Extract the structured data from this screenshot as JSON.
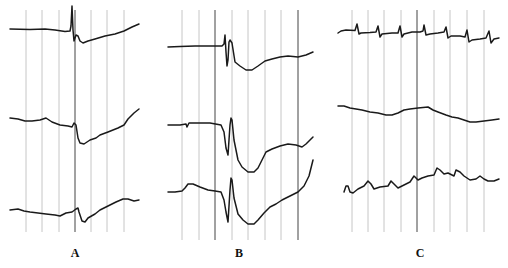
{
  "figure": {
    "background": "#ffffff",
    "panels": [
      {
        "id": "A",
        "label": "A",
        "label_pos": [
          75,
          246
        ],
        "grid": {
          "x": [
            26,
            42,
            59,
            75,
            91,
            107,
            124
          ],
          "dark": [
            75
          ],
          "y_top": 10,
          "y_bottom": 232
        },
        "traces": [
          {
            "d": "M10,29 L30,29.5 L45,29 L55,30 L65,31.5 L70,31 L71,26 L72,6 L73,30 L74,41 L75,38 L76,35 L78,36 L80,41 L83,43 L88,41 L95,39 L105,36 L115,34 L124,31 L132,27 L139,24",
            "dash": false
          },
          {
            "d": "M10,118 L18,119 L25,121 L32,121 L40,120 L46,118 L52,122 L60,125 L68,126 L72,127 L74,123 L76,125 L78,138 L80,143 L84,144 L90,140 L96,138 L100,135 L108,132 L118,128 L124,125 L128,119 L134,113 L139,109",
            "dash": false
          },
          {
            "d": "M10,210 L18,209 L24,211 L30,212 L38,213 L46,214 L55,215 L60,216 L66,213 L72,212 L76,209 L78,208 L79,212 L82,221 L85,222 L88,218 L95,214 L100,210 L108,206 L116,202 L123,199 L128,199 L134,201 L139,200",
            "dash": false
          }
        ]
      },
      {
        "id": "B",
        "label": "B",
        "label_pos": [
          239,
          246
        ],
        "grid": {
          "x": [
            182,
            199,
            215,
            232,
            248,
            265,
            281,
            298
          ],
          "dark": [
            215,
            298
          ],
          "y_top": 10,
          "y_bottom": 240
        },
        "traces": [
          {
            "d": "M168,47 L180,46.5 L195,46 L210,46 L222,46 L224,44 L225,35 L226,52 L227,66 L228,60 L229,42 L230,40 L232,43 L235,62 L240,66 L246,70 L252,70 L258,66 L265,61 L272,59 L280,57 L288,56 L298,57 L306,55 L313,52",
            "dash": false
          },
          {
            "d": "M168,125 L180,125 L186,124 L187,127 L189,123 L198,123 L210,123 L221,125 L224,132 L226,148 L228,155 L230,125 L231,118 L232,120 L234,140 L238,160 L242,167 L248,172 L254,172 L258,168 L262,160 L266,152 L272,149 L280,146 L288,144 L296,145 L302,147 L306,144 L310,140 L313,137",
            "dash": false
          },
          {
            "d": "M168,192 L175,192 L182,191 L185,188 L188,184 L193,184 L200,187 L208,190 L215,191 L221,192 L224,200 L226,212 L228,222 L230,190 L231,178 L232,180 L234,198 L238,214 L243,220 L248,224 L254,224 L258,220 L264,213 L270,207 L276,204 L282,200 L290,196 L298,192 L304,186 L309,176 L313,160",
            "dash": false
          }
        ]
      },
      {
        "id": "C",
        "label": "C",
        "label_pos": [
          420,
          246
        ],
        "grid": {
          "x": [
            352,
            368,
            384,
            401,
            417,
            434,
            450,
            467,
            484
          ],
          "dark": [
            417
          ],
          "y_top": 10,
          "y_bottom": 232
        },
        "traces": [
          {
            "d": "M338,33 L341,31 L346,30 L355,30.5 L357,24 L359,34 L361,33 L370,32.5 L376,32 L378,26 L380,37 L382,34 L392,33 L398,33 L400,26 L402,37 L404,34 L412,32 L420,32 L423,31 L424,25 L426,35 L430,34 L438,33 L444,32 L446,27 L448,38 L451,36 L460,36 L465,37 L467,30 L469,42 L472,40 L480,39 L486,38 L489,31 L491,43 L494,39 L499,38",
            "dash": false
          },
          {
            "d": "M338,106 L344,106 L350,108 L356,109 L362,110 L370,112 L378,113 L386,115 L392,115 L398,113 L404,110 L410,109 L418,108 L428,107 L433,110 L438,112 L446,115 L452,117 L458,118 L464,120 L470,122 L476,122 L484,121 L492,120 L499,119",
            "dash": false
          },
          {
            "d": "M344,192 L346,186 L348,186 L350,192 L353,193 L358,189 L364,186 L368,181 L371,184 L374,189 L380,187 L388,186 L391,181 L394,184 L398,188 L404,185 L410,182 L414,176 L418,180 L422,178 L428,176 L434,175 L437,168 L440,170 L444,174 L448,173 L454,176 L456,170 L460,172 L464,176 L470,180 L476,179 L480,176 L484,179 L488,181 L494,181 L499,179",
            "dash": false
          }
        ]
      }
    ]
  }
}
